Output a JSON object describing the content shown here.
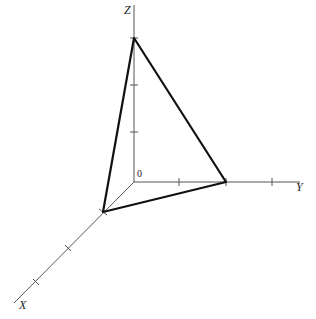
{
  "diagram": {
    "title": "",
    "axes": {
      "x_label": "X",
      "y_label": "Y",
      "z_label": "Z",
      "origin_label": "0"
    },
    "triangle": {
      "vertices": [
        "x-intercept",
        "y-intercept",
        "z-intercept"
      ],
      "x_intercept_units": 1,
      "y_intercept_units": 2,
      "z_intercept_units": 3
    },
    "colors": {
      "axis": "#555555",
      "triangle": "#111111",
      "background": "#ffffff"
    }
  }
}
